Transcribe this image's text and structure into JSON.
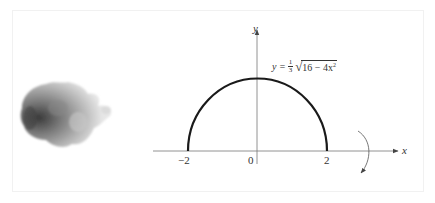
{
  "figure": {
    "equation": {
      "lhs": "y =",
      "fraction_numerator": "1",
      "fraction_denominator": "3",
      "radicand": "16 − 4x",
      "exponent": "2"
    },
    "axes": {
      "x_label": "x",
      "y_label": "y"
    },
    "ticks": {
      "left": "−2",
      "origin": "0",
      "right": "2"
    },
    "curve": {
      "type": "semi-ellipse",
      "x_range": [
        -2,
        2
      ],
      "y_max": 1.3333,
      "stroke_color": "#1a1a1a"
    },
    "rotation_arrow": "rotate-about-x-axis",
    "colors": {
      "axis": "#555555",
      "curve": "#1a1a1a",
      "blob_dark": "#3a3a3a",
      "blob_light": "#cfcfcf"
    }
  }
}
